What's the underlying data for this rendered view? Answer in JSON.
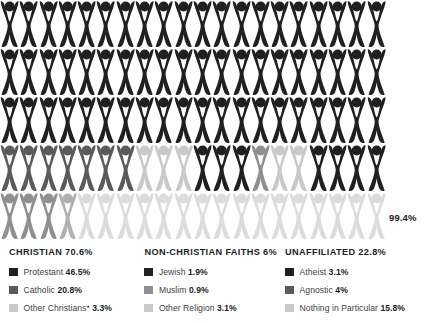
{
  "chart_data": {
    "type": "pictogram",
    "title": "",
    "unit_value": 1,
    "unit_label": "1 figure = 1%",
    "rows": 5,
    "columns": 20,
    "total_label": "99.4%",
    "total_value": 99.4,
    "colors": {
      "black": "#221f1f",
      "dark_gray": "#5a5a5a",
      "mid_gray": "#8f8f8f",
      "light_gray": "#c9c9c9",
      "very_light_gray": "#dcdcdc"
    },
    "series": [
      {
        "name": "Protestant",
        "value": 46.5,
        "color": "#221f1f",
        "group": "Christian"
      },
      {
        "name": "Catholic",
        "value": 20.8,
        "color": "#5a5a5a",
        "group": "Christian"
      },
      {
        "name": "Other Christians*",
        "value": 3.3,
        "color": "#c9c9c9",
        "group": "Christian"
      },
      {
        "name": "Jewish",
        "value": 1.9,
        "color": "#221f1f",
        "group": "Non-Christian Faiths"
      },
      {
        "name": "Muslim",
        "value": 0.9,
        "color": "#8f8f8f",
        "group": "Non-Christian Faiths"
      },
      {
        "name": "Other Religion",
        "value": 3.1,
        "color": "#c9c9c9",
        "group": "Non-Christian Faiths"
      },
      {
        "name": "Atheist",
        "value": 3.1,
        "color": "#221f1f",
        "group": "Unaffiliated"
      },
      {
        "name": "Agnostic",
        "value": 4,
        "color": "#5a5a5a",
        "group": "Unaffiliated"
      },
      {
        "name": "Nothing in Particular",
        "value": 15.8,
        "color": "#c9c9c9",
        "group": "Unaffiliated"
      }
    ],
    "groups": [
      {
        "name": "CHRISTIAN",
        "value": 70.6
      },
      {
        "name": "NON-CHRISTIAN FAITHS",
        "value": 6
      },
      {
        "name": "UNAFFILIATED",
        "value": 22.8
      }
    ],
    "grid_fill_sequence": [
      [
        "#221f1f",
        20
      ],
      [
        "#221f1f",
        20
      ],
      [
        "#221f1f",
        20
      ],
      [
        "#5a5a5a",
        7
      ],
      [
        "#c9c9c9",
        3
      ],
      [
        "#221f1f",
        3
      ],
      [
        "#8f8f8f",
        1
      ],
      [
        "#c9c9c9",
        2
      ],
      [
        "#221f1f",
        4
      ],
      [
        "#8f8f8f",
        3
      ],
      [
        "#b0b0b0",
        1
      ],
      [
        "#dcdcdc",
        16
      ]
    ]
  },
  "pictogram": {
    "total_label": "99.4%"
  },
  "legend": {
    "columns": [
      {
        "heading": "CHRISTIAN 70.6%",
        "items": [
          {
            "label": "Protestant ",
            "value": "46.5%",
            "color": "#221f1f"
          },
          {
            "label": "Catholic ",
            "value": "20.8%",
            "color": "#5a5a5a"
          },
          {
            "label": "Other Christians* ",
            "value": "3.3%",
            "color": "#c9c9c9"
          }
        ]
      },
      {
        "heading": "NON-CHRISTIAN FAITHS 6%",
        "items": [
          {
            "label": "Jewish ",
            "value": "1.9%",
            "color": "#221f1f"
          },
          {
            "label": "Muslim ",
            "value": "0.9%",
            "color": "#8f8f8f"
          },
          {
            "label": "Other Religion ",
            "value": "3.1%",
            "color": "#c9c9c9"
          }
        ]
      },
      {
        "heading": "UNAFFILIATED 22.8%",
        "items": [
          {
            "label": "Atheist ",
            "value": "3.1%",
            "color": "#221f1f"
          },
          {
            "label": "Agnostic ",
            "value": "4%",
            "color": "#5a5a5a"
          },
          {
            "label": "Nothing in Particular ",
            "value": "15.8%",
            "color": "#c9c9c9"
          }
        ]
      }
    ]
  },
  "footnote": {
    "text": ""
  }
}
